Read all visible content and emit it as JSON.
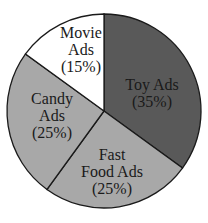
{
  "chart_data": {
    "type": "pie",
    "title": "",
    "categories": [
      "Toy Ads",
      "Fast Food Ads",
      "Candy Ads",
      "Movie Ads"
    ],
    "values": [
      35,
      25,
      25,
      15
    ],
    "unit": "%",
    "colors": [
      "#595959",
      "#a8a8a8",
      "#a8a8a8",
      "#ffffff"
    ],
    "slice_labels": [
      {
        "line1": "Toy Ads",
        "line2": "(35%)"
      },
      {
        "line1": "Fast",
        "line2": "Food Ads",
        "line3": "(25%)"
      },
      {
        "line1": "Candy",
        "line2": "Ads",
        "line3": "(25%)"
      },
      {
        "line1": "Movie",
        "line2": "Ads",
        "line3": "(15%)"
      }
    ],
    "start_angle": "12 o'clock",
    "direction": "clockwise",
    "legend": "none (labels inside slices)"
  }
}
